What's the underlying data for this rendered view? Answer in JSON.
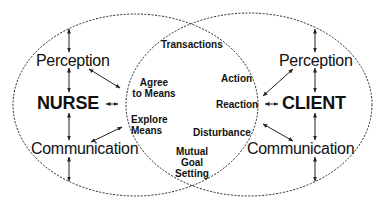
{
  "diagram": {
    "type": "overlapping-ellipses",
    "left_system": {
      "title": "NURSE",
      "top_label": "Perception",
      "bottom_label": "Communication"
    },
    "right_system": {
      "title": "CLIENT",
      "top_label": "Perception",
      "bottom_label": "Communication"
    },
    "overlap": {
      "top_label": "Transactions",
      "left_items": [
        "Agree\nto Means",
        "Explore\nMeans"
      ],
      "right_items": [
        "Action",
        "Reaction",
        "Disturbance"
      ],
      "bottom_label": "Mutual\nGoal\nSetting"
    },
    "labels": {
      "nurse": "NURSE",
      "client": "CLIENT",
      "nurse_perception": "Perception",
      "nurse_communication": "Communication",
      "client_perception": "Perception",
      "client_communication": "Communication",
      "transactions": "Transactions",
      "agree_line1": "Agree",
      "agree_line2": "to Means",
      "explore_line1": "Explore",
      "explore_line2": "Means",
      "action": "Action",
      "reaction": "Reaction",
      "disturbance": "Disturbance",
      "mutual_line1": "Mutual",
      "mutual_line2": "Goal",
      "mutual_line3": "Setting"
    },
    "colors": {
      "stroke": "#222222",
      "text": "#111111",
      "background": "#ffffff"
    }
  }
}
